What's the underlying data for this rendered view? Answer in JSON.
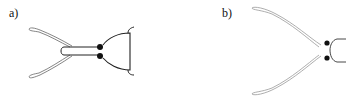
{
  "figure": {
    "panels": [
      {
        "label": "a)",
        "description": "insect head, dorsal view, short rostrum with antennae folded back"
      },
      {
        "label": "b)",
        "description": "insect head, dorsal view, long divergent antennae"
      }
    ],
    "colors": {
      "stroke": "#222222",
      "light_stroke": "#9a9a9a",
      "eye": "#111111",
      "background": "#ffffff"
    }
  }
}
